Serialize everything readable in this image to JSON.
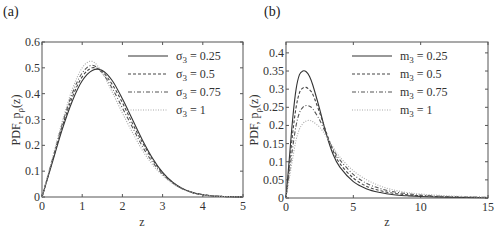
{
  "chart_data": [
    {
      "type": "line",
      "panel_label": "(a)",
      "xlabel": "z",
      "ylabel": "PDF, p_ρ(z)",
      "xlim": [
        0,
        5
      ],
      "ylim": [
        0,
        0.6
      ],
      "xticks": [
        0,
        1,
        2,
        3,
        4,
        5
      ],
      "yticks": [
        0,
        0.1,
        0.2,
        0.3,
        0.4,
        0.5,
        0.6
      ],
      "ytick_labels": [
        "0",
        "0.1",
        "0.2",
        "0.3",
        "0.4",
        "0.5",
        "0.6"
      ],
      "grid": false,
      "legend_position": "upper right",
      "x": [
        0,
        0.25,
        0.5,
        0.75,
        1.0,
        1.25,
        1.5,
        1.75,
        2.0,
        2.25,
        2.5,
        2.75,
        3.0,
        3.25,
        3.5,
        3.75,
        4.0,
        4.25,
        4.5,
        4.75,
        5.0
      ],
      "series": [
        {
          "name": "σ3 = 0.25",
          "style": "solid",
          "color": "#333333",
          "values": [
            0,
            0.13,
            0.26,
            0.37,
            0.45,
            0.49,
            0.49,
            0.45,
            0.38,
            0.3,
            0.22,
            0.15,
            0.095,
            0.057,
            0.032,
            0.017,
            0.009,
            0.004,
            0.002,
            0.001,
            0.0
          ]
        },
        {
          "name": "σ3 = 0.5",
          "style": "dashed",
          "color": "#444444",
          "values": [
            0,
            0.135,
            0.27,
            0.385,
            0.465,
            0.5,
            0.485,
            0.435,
            0.365,
            0.285,
            0.21,
            0.145,
            0.093,
            0.056,
            0.032,
            0.017,
            0.009,
            0.004,
            0.002,
            0.001,
            0.0
          ]
        },
        {
          "name": "σ3 = 0.75",
          "style": "dashdot",
          "color": "#555555",
          "values": [
            0,
            0.14,
            0.28,
            0.4,
            0.48,
            0.51,
            0.48,
            0.42,
            0.345,
            0.27,
            0.195,
            0.135,
            0.088,
            0.054,
            0.031,
            0.017,
            0.009,
            0.004,
            0.002,
            0.001,
            0.0
          ]
        },
        {
          "name": "σ3 = 1",
          "style": "dotted",
          "color": "#aaaaaa",
          "values": [
            0,
            0.145,
            0.29,
            0.415,
            0.5,
            0.525,
            0.48,
            0.405,
            0.325,
            0.25,
            0.18,
            0.125,
            0.083,
            0.052,
            0.03,
            0.016,
            0.008,
            0.004,
            0.002,
            0.001,
            0.0
          ]
        }
      ]
    },
    {
      "type": "line",
      "panel_label": "(b)",
      "xlabel": "z",
      "ylabel": "PDF, p_ρ(z)",
      "xlim": [
        0,
        15
      ],
      "ylim": [
        0,
        0.43
      ],
      "xticks": [
        0,
        5,
        10,
        15
      ],
      "yticks": [
        0,
        0.05,
        0.1,
        0.15,
        0.2,
        0.25,
        0.3,
        0.35,
        0.4
      ],
      "ytick_labels": [
        "0",
        "0.05",
        "0.1",
        "0.15",
        "0.2",
        "0.25",
        "0.3",
        "0.35",
        "0.4"
      ],
      "grid": false,
      "legend_position": "upper right",
      "x": [
        0,
        0.25,
        0.5,
        0.75,
        1.0,
        1.25,
        1.5,
        1.75,
        2.0,
        2.5,
        3.0,
        3.5,
        4.0,
        5.0,
        6.0,
        7.0,
        8.0,
        9.0,
        10.0,
        12.0,
        15.0
      ],
      "series": [
        {
          "name": "m3 = 0.25",
          "style": "solid",
          "color": "#333333",
          "values": [
            0,
            0.11,
            0.22,
            0.3,
            0.34,
            0.35,
            0.348,
            0.335,
            0.31,
            0.245,
            0.175,
            0.12,
            0.085,
            0.045,
            0.025,
            0.015,
            0.009,
            0.006,
            0.004,
            0.002,
            0.001
          ]
        },
        {
          "name": "m3 = 0.5",
          "style": "dashed",
          "color": "#444444",
          "values": [
            0,
            0.09,
            0.18,
            0.25,
            0.29,
            0.303,
            0.305,
            0.298,
            0.285,
            0.235,
            0.18,
            0.13,
            0.095,
            0.055,
            0.032,
            0.02,
            0.013,
            0.009,
            0.006,
            0.003,
            0.001
          ]
        },
        {
          "name": "m3 = 0.75",
          "style": "dashdot",
          "color": "#555555",
          "values": [
            0,
            0.07,
            0.14,
            0.2,
            0.235,
            0.25,
            0.255,
            0.253,
            0.245,
            0.215,
            0.175,
            0.135,
            0.105,
            0.065,
            0.04,
            0.026,
            0.017,
            0.012,
            0.008,
            0.004,
            0.002
          ]
        },
        {
          "name": "m3 = 1",
          "style": "dotted",
          "color": "#aaaaaa",
          "values": [
            0,
            0.055,
            0.11,
            0.16,
            0.19,
            0.205,
            0.212,
            0.214,
            0.21,
            0.195,
            0.17,
            0.14,
            0.113,
            0.075,
            0.05,
            0.033,
            0.022,
            0.015,
            0.011,
            0.006,
            0.002
          ]
        }
      ]
    }
  ],
  "panels": {
    "a": {
      "label": "(a)",
      "xlabel": "z",
      "ylabel": "PDF, p",
      "ylabel_sub": "ρ",
      "ylabel_tail": "(z)"
    },
    "b": {
      "label": "(b)",
      "xlabel": "z",
      "ylabel": "PDF, p",
      "ylabel_sub": "ρ",
      "ylabel_tail": "(z)"
    }
  }
}
